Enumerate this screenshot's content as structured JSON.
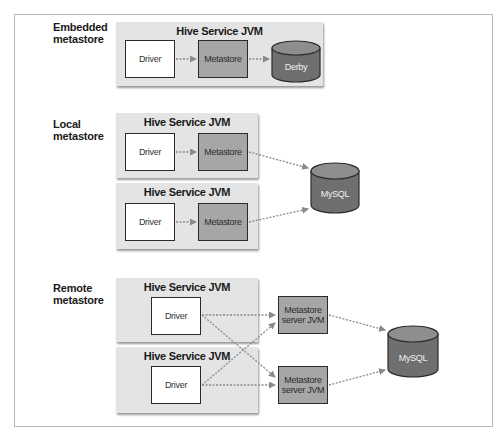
{
  "diagram": {
    "type": "architecture",
    "sections": [
      {
        "label_line1": "Embedded",
        "label_line2": "metastore",
        "jvms": [
          {
            "title": "Hive Service JVM",
            "driver": "Driver",
            "metastore": "Metastore"
          }
        ],
        "database": "Derby"
      },
      {
        "label_line1": "Local",
        "label_line2": "metastore",
        "jvms": [
          {
            "title": "Hive Service JVM",
            "driver": "Driver",
            "metastore": "Metastore"
          },
          {
            "title": "Hive Service JVM",
            "driver": "Driver",
            "metastore": "Metastore"
          }
        ],
        "database": "MySQL"
      },
      {
        "label_line1": "Remote",
        "label_line2": "metastore",
        "jvms": [
          {
            "title": "Hive Service JVM",
            "driver": "Driver"
          },
          {
            "title": "Hive Service JVM",
            "driver": "Driver"
          }
        ],
        "metastore_servers": [
          {
            "line1": "Metastore",
            "line2": "server JVM"
          },
          {
            "line1": "Metastore",
            "line2": "server JVM"
          }
        ],
        "database": "MySQL"
      }
    ],
    "colors": {
      "jvm_panel": "#e4e4e4",
      "metastore_box": "#a6a6a6",
      "cylinder_top": "#8e8e8e",
      "cylinder_body": "#6f6f6f",
      "arrow": "#8a8a8a"
    }
  }
}
